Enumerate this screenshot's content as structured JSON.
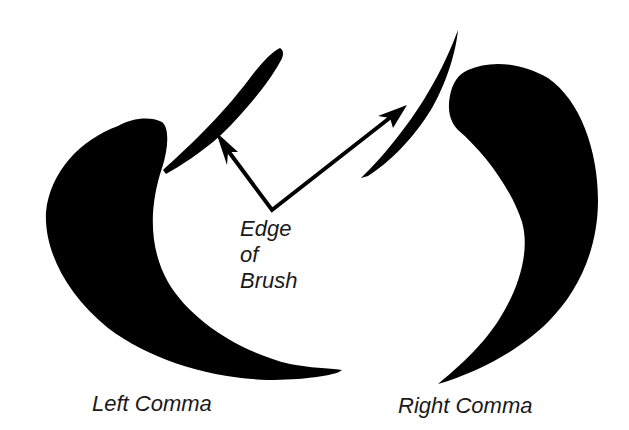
{
  "figure": {
    "ink_color": "#000000",
    "background": "#ffffff",
    "annotation": {
      "lines": [
        "Edge",
        "of",
        "Brush"
      ]
    },
    "labels": {
      "left_comma": "Left Comma",
      "right_comma": "Right Comma"
    },
    "shapes": [
      {
        "name": "left-comma-stroke",
        "description": "black crescent brush stroke curving left and sweeping right at bottom"
      },
      {
        "name": "right-comma-stroke",
        "description": "black crescent brush stroke curving right with tail sweeping to lower left"
      },
      {
        "name": "left-brush-edge",
        "description": "thin diagonal brush-edge stroke"
      },
      {
        "name": "right-brush-edge",
        "description": "thin curved brush-edge stroke"
      }
    ],
    "arrows": [
      {
        "from": [
          272,
          210
        ],
        "to": [
          216,
          133
        ],
        "target": "left-brush-edge"
      },
      {
        "from": [
          272,
          210
        ],
        "to": [
          405,
          106
        ],
        "target": "right-brush-edge"
      }
    ]
  }
}
